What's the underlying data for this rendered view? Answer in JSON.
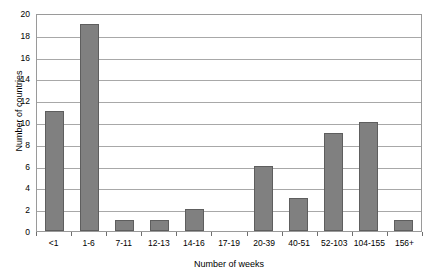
{
  "chart_data": {
    "type": "bar",
    "title": "",
    "subtitle": "",
    "xlabel": "Number of weeks",
    "ylabel": "Number of countries",
    "categories": [
      "<1",
      "1-6",
      "7-11",
      "12-13",
      "14-16",
      "17-19",
      "20-39",
      "40-51",
      "52-103",
      "104-155",
      "156+"
    ],
    "values": [
      11,
      19,
      1,
      1,
      2,
      0,
      6,
      3,
      9,
      10,
      1
    ],
    "ylim": [
      0,
      20
    ],
    "ytick_values": [
      0,
      2,
      4,
      6,
      8,
      10,
      12,
      14,
      16,
      18,
      20
    ],
    "ytick_labels": [
      "0",
      "2",
      "4",
      "6",
      "8",
      "10",
      "12",
      "14",
      "16",
      "18",
      "20"
    ],
    "grid": "horizontal",
    "legend": "none",
    "bar_color": "#808080",
    "bar_edge_color": "#5e5e5e",
    "gridline_color": "#a8a8a8",
    "frame_color": "#9a9a9a",
    "background": "#ffffff"
  }
}
